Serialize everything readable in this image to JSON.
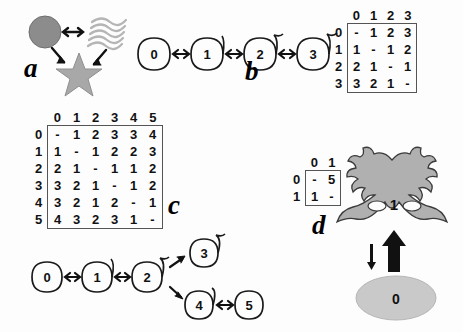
{
  "figure": {
    "caption_letters": [
      "a",
      "b",
      "c",
      "d"
    ],
    "bidirectional_arrow": "↔"
  },
  "panel_a": {
    "letter": "a",
    "shapes": [
      {
        "name": "circle",
        "fill": "#8c8c8c"
      },
      {
        "name": "waves",
        "fill": "#bdbdbd"
      },
      {
        "name": "star",
        "fill": "#a8a8a8"
      }
    ],
    "links": [
      "circle ↔ waves",
      "circle ↔ star",
      "waves ↔ star"
    ],
    "arrow": "↔"
  },
  "panel_b": {
    "letter": "b",
    "graph": {
      "nodes": [
        "0",
        "1",
        "2",
        "3"
      ],
      "edges": [
        [
          "0",
          "1"
        ],
        [
          "1",
          "2"
        ],
        [
          "2",
          "3"
        ]
      ],
      "edge_symbol": "↔"
    },
    "matrix": {
      "col_headers": [
        "0",
        "1",
        "2",
        "3"
      ],
      "row_headers": [
        "0",
        "1",
        "2",
        "3"
      ],
      "rows": [
        [
          "-",
          "1",
          "2",
          "3"
        ],
        [
          "1",
          "-",
          "1",
          "2"
        ],
        [
          "2",
          "1",
          "-",
          "1"
        ],
        [
          "3",
          "2",
          "1",
          "-"
        ]
      ]
    }
  },
  "panel_c": {
    "letter": "c",
    "graph": {
      "nodes": [
        "0",
        "1",
        "2",
        "3",
        "4",
        "5"
      ],
      "edges": [
        [
          "0",
          "1"
        ],
        [
          "1",
          "2"
        ],
        [
          "2",
          "3"
        ],
        [
          "2",
          "4"
        ],
        [
          "4",
          "5"
        ]
      ],
      "edge_symbol": "↔"
    },
    "matrix": {
      "col_headers": [
        "0",
        "1",
        "2",
        "3",
        "4",
        "5"
      ],
      "row_headers": [
        "0",
        "1",
        "2",
        "3",
        "4",
        "5"
      ],
      "rows": [
        [
          "-",
          "1",
          "2",
          "3",
          "3",
          "4"
        ],
        [
          "1",
          "-",
          "1",
          "2",
          "2",
          "3"
        ],
        [
          "2",
          "1",
          "-",
          "1",
          "1",
          "2"
        ],
        [
          "3",
          "2",
          "1",
          "-",
          "1",
          "2"
        ],
        [
          "3",
          "2",
          "1",
          "2",
          "-",
          "1"
        ],
        [
          "4",
          "3",
          "2",
          "3",
          "1",
          "-"
        ]
      ]
    }
  },
  "panel_d": {
    "letter": "d",
    "matrix": {
      "col_headers": [
        "0",
        "1"
      ],
      "row_headers": [
        "0",
        "1"
      ],
      "rows": [
        [
          "-",
          "5"
        ],
        [
          "1",
          "-"
        ]
      ]
    },
    "states": [
      {
        "name": "coral-shape",
        "label": "1",
        "fill": "#b0b0b0"
      },
      {
        "name": "ellipse-shape",
        "label": "0",
        "fill": "#c9c9c9"
      }
    ],
    "transitions": [
      {
        "name": "up-arrow",
        "direction": "up",
        "weight": "thick"
      },
      {
        "name": "down-arrow",
        "direction": "down",
        "weight": "thin"
      }
    ]
  }
}
